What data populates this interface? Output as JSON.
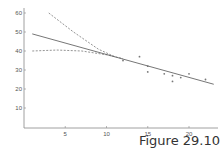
{
  "caption": "Figure 29.10",
  "chart_data": {
    "type": "scatter",
    "title": "",
    "xlabel": "",
    "ylabel": "",
    "xlim": [
      0,
      23
    ],
    "ylim": [
      0,
      63
    ],
    "grid": false,
    "x_ticks": [
      5,
      10,
      15,
      20
    ],
    "y_ticks": [
      10,
      20,
      30,
      40,
      50,
      60
    ],
    "points": [
      {
        "x": 12,
        "y": 35
      },
      {
        "x": 14,
        "y": 37
      },
      {
        "x": 15,
        "y": 32
      },
      {
        "x": 15,
        "y": 29
      },
      {
        "x": 17,
        "y": 28
      },
      {
        "x": 18,
        "y": 27
      },
      {
        "x": 18,
        "y": 24
      },
      {
        "x": 19,
        "y": 26
      },
      {
        "x": 20,
        "y": 28
      },
      {
        "x": 22,
        "y": 25
      }
    ],
    "series": [
      {
        "name": "fitted line",
        "style": "solid",
        "x": [
          1,
          23
        ],
        "y": [
          49,
          22.5
        ]
      },
      {
        "name": "upper confidence band",
        "style": "dashed",
        "x": [
          3,
          6,
          9,
          11
        ],
        "y": [
          60,
          50,
          41,
          37
        ]
      },
      {
        "name": "lower confidence band",
        "style": "dashed",
        "x": [
          1,
          4,
          7,
          10,
          12
        ],
        "y": [
          40,
          40.5,
          40,
          38,
          36
        ]
      }
    ]
  }
}
